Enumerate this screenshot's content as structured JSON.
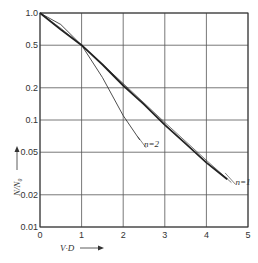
{
  "chart_data": {
    "type": "line",
    "title": "",
    "xlabel": "V·D",
    "ylabel": "N/N₀",
    "xlim": [
      0,
      5
    ],
    "ylim": [
      0.01,
      1.0
    ],
    "yscale": "log",
    "grid": true,
    "x_ticks": [
      "0",
      "1",
      "2",
      "3",
      "4",
      "5"
    ],
    "y_ticks": [
      "1.0",
      "0.5",
      "0.2",
      "0.1",
      "0.05",
      "0.02",
      "0.01"
    ],
    "series": [
      {
        "name": "n=1",
        "label": "n=1",
        "x": [
          0,
          0.5,
          1,
          1.5,
          2,
          2.5,
          3,
          3.5,
          4,
          4.5
        ],
        "y": [
          1.0,
          0.7,
          0.5,
          0.33,
          0.21,
          0.14,
          0.09,
          0.06,
          0.04,
          0.028
        ]
      },
      {
        "name": "n=2",
        "label": "n=2",
        "x": [
          0,
          0.5,
          1,
          1.5,
          2,
          2.4
        ],
        "y": [
          1.0,
          0.78,
          0.5,
          0.25,
          0.11,
          0.065
        ]
      },
      {
        "name": "reference (thin)",
        "label": "",
        "x": [
          0,
          0.5,
          1,
          2,
          3,
          4,
          4.6
        ],
        "y": [
          1.0,
          0.72,
          0.5,
          0.22,
          0.095,
          0.042,
          0.026
        ]
      }
    ],
    "annotations": [
      {
        "text": "n=2",
        "x": 2.5,
        "y": 0.07
      },
      {
        "text": "n=1",
        "x": 4.7,
        "y": 0.028
      }
    ]
  },
  "axis": {
    "xlabel": "V·D",
    "ylabel": "N/N₀"
  }
}
